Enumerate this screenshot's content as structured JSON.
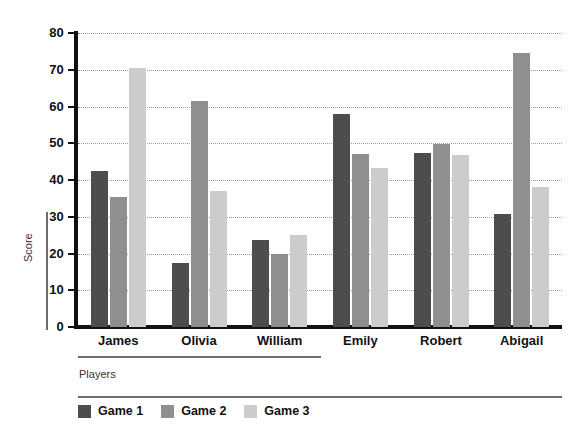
{
  "chart_data": {
    "type": "bar",
    "title": "",
    "subtitle": "",
    "xlabel": "Players",
    "ylabel": "Score",
    "categories": [
      "James",
      "Olivia",
      "William",
      "Emily",
      "Robert",
      "Abigail"
    ],
    "series": [
      {
        "name": "Game 1",
        "color": "#4d4d4d",
        "values": [
          42.5,
          17.5,
          23.8,
          58.0,
          47.3,
          30.7
        ]
      },
      {
        "name": "Game 2",
        "color": "#8f8f8f",
        "values": [
          35.5,
          61.5,
          19.8,
          47.0,
          49.7,
          74.5
        ]
      },
      {
        "name": "Game 3",
        "color": "#cccccc",
        "values": [
          70.5,
          37.0,
          25.0,
          43.3,
          46.8,
          38.0
        ]
      }
    ],
    "ylim": [
      0,
      80
    ],
    "yticks": [
      0,
      10,
      20,
      30,
      40,
      50,
      60,
      70,
      80
    ],
    "ytick_labels": [
      "0",
      "10",
      "20",
      "30",
      "40",
      "50",
      "60",
      "70",
      "80"
    ],
    "grid": true,
    "grid_style": "dotted",
    "legend_position": "bottom-left",
    "orientation": "vertical",
    "grouping": "grouped"
  },
  "axes": {
    "y_title": "Score",
    "x_title": "Players"
  },
  "legend": {
    "entries": [
      {
        "label": "Game 1",
        "swatch": "legend-swatch-game-1"
      },
      {
        "label": "Game 2",
        "swatch": "legend-swatch-game-2"
      },
      {
        "label": "Game 3",
        "swatch": "legend-swatch-game-3"
      }
    ]
  },
  "colors": {
    "series_1": "#4d4d4d",
    "series_2": "#8f8f8f",
    "series_3": "#cccccc",
    "axis": "#111111",
    "grid": "#9a9a9a",
    "rule": "#6e6e6e",
    "background": "#ffffff"
  }
}
